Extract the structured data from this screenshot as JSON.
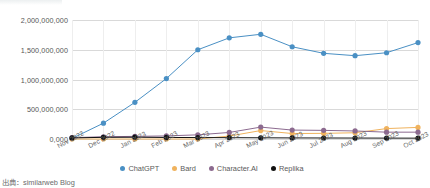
{
  "source_note": "出典：similarweb Blog",
  "legend": {
    "position": "bottom-center",
    "items": [
      {
        "label": "ChatGPT",
        "color": "#4a90c4"
      },
      {
        "label": "Bard",
        "color": "#f0b35e"
      },
      {
        "label": "Character.AI",
        "color": "#8c6a8f"
      },
      {
        "label": "Replika",
        "color": "#111111"
      }
    ]
  },
  "chart_data": {
    "type": "line",
    "title": "",
    "subtitle": "",
    "xlabel": "",
    "ylabel": "",
    "grid": true,
    "legend_position": "bottom",
    "ylim": [
      0,
      2000000000
    ],
    "ytick_labels": [
      "2,000,000,000",
      "1,500,000,000",
      "1,000,000,000",
      "500,000,000",
      "0,000"
    ],
    "ytick_values": [
      2000000000,
      1500000000,
      1000000000,
      500000000,
      0
    ],
    "categories": [
      "Nov 2022",
      "Dec 2022",
      "Jan 2023",
      "Feb 2023",
      "Mar 2023",
      "Apr 2023",
      "May 2023",
      "Jun 2023",
      "Jul 2023",
      "Aug 2023",
      "Sep 2023",
      "Oct 2023"
    ],
    "series": [
      {
        "name": "ChatGPT",
        "color": "#4a90c4",
        "values": [
          10000000,
          266000000,
          616000000,
          1016000000,
          1500000000,
          1700000000,
          1760000000,
          1550000000,
          1440000000,
          1400000000,
          1450000000,
          1620000000
        ]
      },
      {
        "name": "Bard",
        "color": "#f0b35e",
        "values": [
          0,
          0,
          0,
          0,
          0,
          49000000,
          142000000,
          92000000,
          95000000,
          105000000,
          175000000,
          195000000
        ]
      },
      {
        "name": "Character.AI",
        "color": "#8c6a8f",
        "values": [
          22000000,
          38000000,
          44000000,
          52000000,
          70000000,
          110000000,
          200000000,
          150000000,
          145000000,
          135000000,
          115000000,
          115000000
        ]
      },
      {
        "name": "Replika",
        "color": "#111111",
        "values": [
          18000000,
          28000000,
          30000000,
          26000000,
          24000000,
          22000000,
          20000000,
          18000000,
          17000000,
          16000000,
          15000000,
          14000000
        ]
      }
    ]
  }
}
